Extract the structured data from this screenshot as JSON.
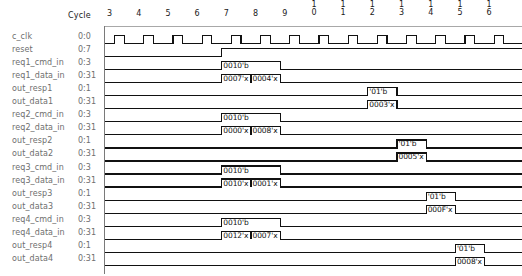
{
  "header": {
    "cycle_label": "Cycle",
    "cycles": [
      "3",
      "4",
      "5",
      "6",
      "7",
      "8",
      "9",
      "10",
      "11",
      "12",
      "13",
      "14",
      "15",
      "16"
    ]
  },
  "colors": {
    "signal_name": "#6e6e6e",
    "wave_line": "#111111",
    "axis": "#8a8a8a",
    "background": "#ffffff",
    "value_text": "#111111"
  },
  "signals": [
    {
      "name": "c_clk",
      "range": "0:0",
      "type": "clock",
      "values": []
    },
    {
      "name": "reset",
      "range": "0:7",
      "type": "level",
      "values": []
    },
    {
      "name": "req1_cmd_in",
      "range": "0:3",
      "type": "bus",
      "values": [
        "0010'b"
      ]
    },
    {
      "name": "req1_data_in",
      "range": "0:31",
      "type": "bus",
      "values": [
        "0007'x",
        "0004'x"
      ]
    },
    {
      "name": "out_resp1",
      "range": "0:1",
      "type": "bus",
      "values": [
        "'01'b"
      ]
    },
    {
      "name": "out_data1",
      "range": "0:31",
      "type": "bus",
      "values": [
        "0003'x"
      ]
    },
    {
      "name": "req2_cmd_in",
      "range": "0:3",
      "type": "bus",
      "values": [
        "0010'b"
      ]
    },
    {
      "name": "req2_data_in",
      "range": "0:31",
      "type": "bus",
      "values": [
        "0000'x",
        "0008'x"
      ]
    },
    {
      "name": "out_resp2",
      "range": "0:1",
      "type": "bus",
      "values": [
        "'01'b"
      ]
    },
    {
      "name": "out_data2",
      "range": "0:31",
      "type": "bus",
      "values": [
        "0005'x"
      ]
    },
    {
      "name": "req3_cmd_in",
      "range": "0:3",
      "type": "bus",
      "values": [
        "0010'b"
      ]
    },
    {
      "name": "req3_data_in",
      "range": "0:31",
      "type": "bus",
      "values": [
        "0010'x",
        "0001'x"
      ]
    },
    {
      "name": "out_resp3",
      "range": "0:1",
      "type": "bus",
      "values": [
        "'01'b"
      ]
    },
    {
      "name": "out_data3",
      "range": "0:31",
      "type": "bus",
      "values": [
        "000F'x"
      ]
    },
    {
      "name": "req4_cmd_in",
      "range": "0:3",
      "type": "bus",
      "values": [
        "0010'b"
      ]
    },
    {
      "name": "req4_data_in",
      "range": "0:31",
      "type": "bus",
      "values": [
        "0012'x",
        "0007'x"
      ]
    },
    {
      "name": "out_resp4",
      "range": "0:1",
      "type": "bus",
      "values": [
        "'01'b"
      ]
    },
    {
      "name": "out_data4",
      "range": "0:31",
      "type": "bus",
      "values": [
        "0008'x"
      ]
    }
  ],
  "chart_data": {
    "type": "table",
    "xlabel": "Cycle",
    "x": [
      3,
      4,
      5,
      6,
      7,
      8,
      9,
      10,
      11,
      12,
      13,
      14,
      15,
      16
    ],
    "series": [
      {
        "name": "c_clk",
        "pulses_per_cycle": 1,
        "active": "cycles 3-16"
      },
      {
        "name": "reset",
        "transition_cycle": 7,
        "from": "low",
        "to": "high"
      },
      {
        "name": "req1_cmd_in",
        "segments": [
          {
            "value": "0010'b",
            "start": 7,
            "end": 9
          }
        ]
      },
      {
        "name": "req1_data_in",
        "segments": [
          {
            "value": "0007'x",
            "start": 7,
            "end": 8
          },
          {
            "value": "0004'x",
            "start": 8,
            "end": 9
          }
        ]
      },
      {
        "name": "out_resp1",
        "segments": [
          {
            "value": "'01'b",
            "start": 12,
            "end": 13
          }
        ]
      },
      {
        "name": "out_data1",
        "segments": [
          {
            "value": "0003'x",
            "start": 12,
            "end": 13
          }
        ]
      },
      {
        "name": "req2_cmd_in",
        "segments": [
          {
            "value": "0010'b",
            "start": 7,
            "end": 9
          }
        ]
      },
      {
        "name": "req2_data_in",
        "segments": [
          {
            "value": "0000'x",
            "start": 7,
            "end": 8
          },
          {
            "value": "0008'x",
            "start": 8,
            "end": 9
          }
        ]
      },
      {
        "name": "out_resp2",
        "segments": [
          {
            "value": "'01'b",
            "start": 13,
            "end": 14
          }
        ]
      },
      {
        "name": "out_data2",
        "segments": [
          {
            "value": "0005'x",
            "start": 13,
            "end": 14
          }
        ]
      },
      {
        "name": "req3_cmd_in",
        "segments": [
          {
            "value": "0010'b",
            "start": 7,
            "end": 9
          }
        ]
      },
      {
        "name": "req3_data_in",
        "segments": [
          {
            "value": "0010'x",
            "start": 7,
            "end": 8
          },
          {
            "value": "0001'x",
            "start": 8,
            "end": 9
          }
        ]
      },
      {
        "name": "out_resp3",
        "segments": [
          {
            "value": "'01'b",
            "start": 14,
            "end": 15
          }
        ]
      },
      {
        "name": "out_data3",
        "segments": [
          {
            "value": "000F'x",
            "start": 14,
            "end": 15
          }
        ]
      },
      {
        "name": "req4_cmd_in",
        "segments": [
          {
            "value": "0010'b",
            "start": 7,
            "end": 9
          }
        ]
      },
      {
        "name": "req4_data_in",
        "segments": [
          {
            "value": "0012'x",
            "start": 7,
            "end": 8
          },
          {
            "value": "0007'x",
            "start": 8,
            "end": 9
          }
        ]
      },
      {
        "name": "out_resp4",
        "segments": [
          {
            "value": "'01'b",
            "start": 15,
            "end": 16
          }
        ]
      },
      {
        "name": "out_data4",
        "segments": [
          {
            "value": "0008'x",
            "start": 15,
            "end": 16
          }
        ]
      }
    ]
  }
}
